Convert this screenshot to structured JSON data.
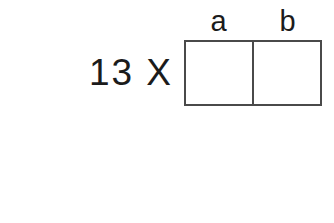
{
  "figure": {
    "title": "",
    "background_color": "#ffffff",
    "line_color": "#4a4a4a",
    "text_color": "#1b1b1b"
  },
  "rows": [
    {
      "expression": "13 X",
      "headers": [
        "a",
        "b"
      ],
      "cells": [
        "",
        ""
      ]
    },
    {
      "expression": "= 31 X",
      "headers": [
        "b",
        "a"
      ],
      "cells": [
        "",
        ""
      ]
    }
  ]
}
